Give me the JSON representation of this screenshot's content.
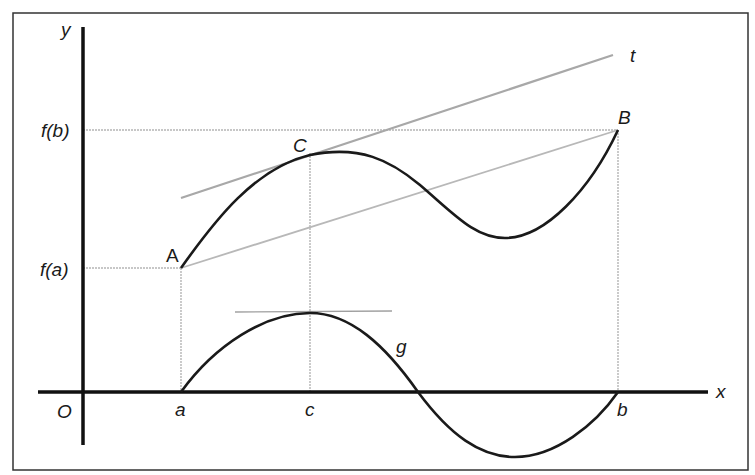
{
  "diagram": {
    "axes": {
      "x_label": "x",
      "y_label": "y",
      "origin_label": "O"
    },
    "y_ticks": [
      {
        "label": "f(b)",
        "y": 130
      },
      {
        "label": "f(a)",
        "y": 268
      }
    ],
    "x_ticks": [
      {
        "label": "a",
        "x": 181
      },
      {
        "label": "c",
        "x": 310
      },
      {
        "label": "b",
        "x": 618
      }
    ],
    "points": [
      {
        "label": "A",
        "x": 181,
        "y": 268
      },
      {
        "label": "C",
        "x": 310,
        "y": 153
      },
      {
        "label": "B",
        "x": 618,
        "y": 130
      }
    ],
    "curves": [
      {
        "name": "f",
        "label": "",
        "description": "function from A through max near C, min, to B"
      },
      {
        "name": "g",
        "label": "g",
        "description": "auxiliary function, zero at a and b, max at c"
      }
    ],
    "lines": [
      {
        "name": "tangent",
        "label": "t",
        "description": "tangent at C parallel to secant AB"
      },
      {
        "name": "secant",
        "label": "",
        "description": "line from A to B"
      },
      {
        "name": "g-max-tangent",
        "label": "",
        "description": "horizontal tangent at g maximum"
      }
    ],
    "colors": {
      "curve": "#1a1a1a",
      "axis": "#111111",
      "guide": "#b0b0b0",
      "frame": "#333333"
    }
  }
}
